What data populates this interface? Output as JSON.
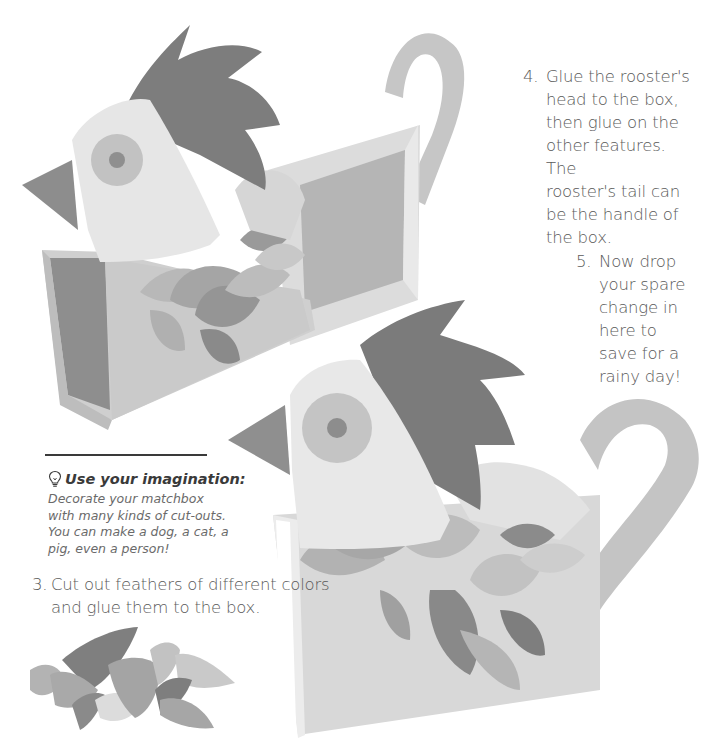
{
  "steps": [
    {
      "number": "3.",
      "lines": [
        "Cut out feathers of different colors",
        "and glue them to the box."
      ]
    },
    {
      "number": "4.",
      "lines": [
        "Glue the rooster's",
        "head to the box,",
        "then glue on the",
        "other features. The",
        "rooster's tail can",
        "be the handle of",
        "the box."
      ]
    },
    {
      "number": "5.",
      "lines": [
        "Now drop",
        "your spare",
        "change in",
        "here to",
        "save for a",
        "rainy day!"
      ]
    }
  ],
  "tip": {
    "icon": "lightbulb-icon",
    "heading": "Use your imagination:",
    "lines": [
      "Decorate your matchbox",
      "with many kinds of cut-outs.",
      "You can make a dog, a cat, a",
      "pig, even a person!"
    ]
  },
  "images": {
    "rooster_box_open": "rooster-matchbox-open",
    "rooster_box_closed": "rooster-matchbox-closed",
    "feather_cutouts": "feather-cutouts"
  },
  "colors": {
    "comb": "#7d7d7d",
    "head": "#e6e6e6",
    "box": "#c9c9c9",
    "feather_dark": "#8a8a8a",
    "feather_mid": "#ababab",
    "feather_light": "#c4c4c4",
    "text": "#5a5a5a"
  }
}
